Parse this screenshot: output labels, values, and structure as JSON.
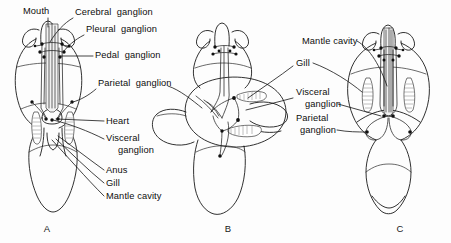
{
  "figure": {
    "background_color": "#fdfdfd",
    "ink_color": "#101010",
    "width": 451,
    "height": 243
  },
  "panels": [
    {
      "letter": "A",
      "x": 47,
      "y": 232,
      "description": "untorted pre-veliger, dorsal view"
    },
    {
      "letter": "B",
      "x": 228,
      "y": 232,
      "description": "partially torted, intermediate view"
    },
    {
      "letter": "C",
      "x": 400,
      "y": 232,
      "description": "fully torted adult, dorsal view"
    }
  ],
  "labels": [
    {
      "id": "mouth",
      "text": "Mouth",
      "x": 23,
      "y": 14,
      "panel": "A",
      "anchor": "start"
    },
    {
      "id": "cerebral-ganglion",
      "text": "Cerebral  ganglion",
      "x": 75,
      "y": 15,
      "panel": "A",
      "anchor": "start"
    },
    {
      "id": "pleural-ganglion",
      "text": "Pleural  ganglion",
      "x": 86,
      "y": 32,
      "panel": "A",
      "anchor": "start"
    },
    {
      "id": "pedal-ganglion",
      "text": "Pedal  ganglion",
      "x": 95,
      "y": 58,
      "panel": "A",
      "anchor": "start"
    },
    {
      "id": "parietal-ganglion-a",
      "text": "Parietal  ganglion",
      "x": 98,
      "y": 86,
      "panel": "A",
      "anchor": "start"
    },
    {
      "id": "heart",
      "text": "Heart",
      "x": 106,
      "y": 124,
      "panel": "A",
      "anchor": "start"
    },
    {
      "id": "visceral-ganglion-a",
      "text": "Visceral",
      "x": 106,
      "y": 141,
      "panel": "A",
      "anchor": "start"
    },
    {
      "id": "visceral-ganglion-a2",
      "text": "ganglion",
      "x": 118,
      "y": 153,
      "panel": "A",
      "anchor": "start"
    },
    {
      "id": "anus",
      "text": "Anus",
      "x": 106,
      "y": 173,
      "panel": "A",
      "anchor": "start"
    },
    {
      "id": "gill-a",
      "text": "Gill",
      "x": 106,
      "y": 186,
      "panel": "A",
      "anchor": "start"
    },
    {
      "id": "mantle-cavity-a",
      "text": "Mantle cavity",
      "x": 106,
      "y": 199,
      "panel": "A",
      "anchor": "start"
    },
    {
      "id": "mantle-cavity-c",
      "text": "Mantle cavity",
      "x": 302,
      "y": 44,
      "panel": "C",
      "anchor": "start"
    },
    {
      "id": "gill-c",
      "text": "Gill",
      "x": 296,
      "y": 66,
      "panel": "C",
      "anchor": "start"
    },
    {
      "id": "visceral-ganglion-c",
      "text": "Visceral",
      "x": 296,
      "y": 95,
      "panel": "C",
      "anchor": "start"
    },
    {
      "id": "visceral-ganglion-c2",
      "text": "ganglion",
      "x": 305,
      "y": 107,
      "panel": "C",
      "anchor": "start"
    },
    {
      "id": "parietal-ganglion-c",
      "text": "Parietal",
      "x": 296,
      "y": 121,
      "panel": "C",
      "anchor": "start"
    },
    {
      "id": "parietal-ganglion-c2",
      "text": "ganglion",
      "x": 300,
      "y": 133,
      "panel": "C",
      "anchor": "start"
    }
  ],
  "anatomy": {
    "ganglion_types": [
      "cerebral",
      "pleural",
      "pedal",
      "parietal",
      "visceral"
    ],
    "organs": [
      "mouth",
      "heart",
      "anus",
      "gill",
      "mantle cavity"
    ],
    "panel_a_view": "dorsal, untorted",
    "panel_b_view": "oblique, torting",
    "panel_c_view": "dorsal, torted"
  }
}
